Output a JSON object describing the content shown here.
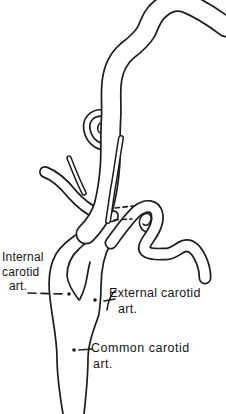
{
  "canvas": {
    "width": 226,
    "height": 414,
    "background": "#ffffff",
    "ink": "#1c1c1c"
  },
  "labels": {
    "internal": {
      "line1": "Internal",
      "line2": "carotid",
      "line3": "art."
    },
    "external": {
      "line1": "External carotid",
      "line2": "art."
    },
    "common": {
      "line1": "Common carotid",
      "line2": "art."
    }
  }
}
